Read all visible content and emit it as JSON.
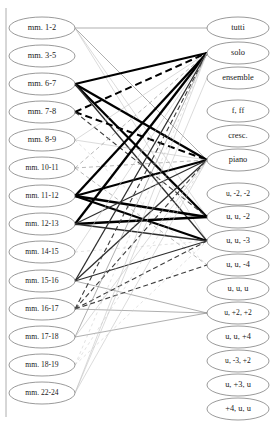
{
  "figure": {
    "type": "bipartite-graph",
    "title": "",
    "width": 274,
    "height": 425,
    "background": "#ffffff",
    "border_color": "#9a9a9a"
  },
  "left_nodes": [
    {
      "id": "L0",
      "label": "mm. 1-2",
      "x": 42,
      "y": 28,
      "rx": 33,
      "ry": 11
    },
    {
      "id": "L1",
      "label": "mm. 3-5",
      "x": 42,
      "y": 56,
      "rx": 33,
      "ry": 11
    },
    {
      "id": "L2",
      "label": "mm. 6-7",
      "x": 42,
      "y": 84,
      "rx": 33,
      "ry": 11
    },
    {
      "id": "L3",
      "label": "mm. 7-8",
      "x": 42,
      "y": 112,
      "rx": 33,
      "ry": 11
    },
    {
      "id": "L4",
      "label": "mm. 8-9",
      "x": 42,
      "y": 140,
      "rx": 33,
      "ry": 11
    },
    {
      "id": "L5",
      "label": "mm. 10-11",
      "x": 42,
      "y": 168,
      "rx": 33,
      "ry": 11
    },
    {
      "id": "L6",
      "label": "mm. 11-12",
      "x": 42,
      "y": 196,
      "rx": 33,
      "ry": 11
    },
    {
      "id": "L7",
      "label": "mm. 12-13",
      "x": 42,
      "y": 224,
      "rx": 33,
      "ry": 11
    },
    {
      "id": "L8",
      "label": "mm. 14-15",
      "x": 42,
      "y": 252,
      "rx": 33,
      "ry": 11
    },
    {
      "id": "L9",
      "label": "mm. 15-16",
      "x": 42,
      "y": 281,
      "rx": 33,
      "ry": 11
    },
    {
      "id": "L10",
      "label": "mm. 16-17",
      "x": 42,
      "y": 309,
      "rx": 33,
      "ry": 11
    },
    {
      "id": "L11",
      "label": "mm. 17-18",
      "x": 42,
      "y": 337,
      "rx": 33,
      "ry": 11
    },
    {
      "id": "L12",
      "label": "mm. 18-19",
      "x": 42,
      "y": 365,
      "rx": 33,
      "ry": 11
    },
    {
      "id": "L13",
      "label": "mm. 22-24",
      "x": 42,
      "y": 393,
      "rx": 33,
      "ry": 11
    }
  ],
  "right_nodes": [
    {
      "id": "R0",
      "label": "tutti",
      "x": 238,
      "y": 28,
      "rx": 31,
      "ry": 11
    },
    {
      "id": "R1",
      "label": "solo",
      "x": 238,
      "y": 53,
      "rx": 31,
      "ry": 11
    },
    {
      "id": "R2",
      "label": "ensemble",
      "x": 238,
      "y": 78,
      "rx": 31,
      "ry": 11
    },
    {
      "id": "R3",
      "label": "f, ff",
      "x": 238,
      "y": 111,
      "rx": 31,
      "ry": 11
    },
    {
      "id": "R4",
      "label": "cresc.",
      "x": 238,
      "y": 136,
      "rx": 31,
      "ry": 11
    },
    {
      "id": "R5",
      "label": "piano",
      "x": 238,
      "y": 160,
      "rx": 31,
      "ry": 11
    },
    {
      "id": "R6",
      "label": "u, -2, -2",
      "x": 238,
      "y": 194,
      "rx": 31,
      "ry": 11
    },
    {
      "id": "R7",
      "label": "u, u, -2",
      "x": 238,
      "y": 217,
      "rx": 31,
      "ry": 11
    },
    {
      "id": "R8",
      "label": "u, u, -3",
      "x": 238,
      "y": 241,
      "rx": 31,
      "ry": 11
    },
    {
      "id": "R9",
      "label": "u, u, -4",
      "x": 238,
      "y": 265,
      "rx": 31,
      "ry": 11
    },
    {
      "id": "R10",
      "label": "u, u, u",
      "x": 238,
      "y": 289,
      "rx": 31,
      "ry": 11
    },
    {
      "id": "R11",
      "label": "u, +2, +2",
      "x": 238,
      "y": 313,
      "rx": 31,
      "ry": 11
    },
    {
      "id": "R12",
      "label": "u, u, +4",
      "x": 238,
      "y": 337,
      "rx": 31,
      "ry": 11
    },
    {
      "id": "R13",
      "label": "u, -3, +2",
      "x": 238,
      "y": 361,
      "rx": 31,
      "ry": 11
    },
    {
      "id": "R14",
      "label": "u, +3, u",
      "x": 238,
      "y": 385,
      "rx": 31,
      "ry": 11
    },
    {
      "id": "R15",
      "label": "+4, u, u",
      "x": 238,
      "y": 409,
      "rx": 31,
      "ry": 11
    }
  ],
  "edge_styles": {
    "thick_solid": {
      "color": "#000000",
      "width": 2.3,
      "dash": "none"
    },
    "thick_dashed": {
      "color": "#000000",
      "width": 2.0,
      "dash": "7,4"
    },
    "medium_solid": {
      "color": "#2e2e2e",
      "width": 1.3,
      "dash": "none"
    },
    "medium_dashed": {
      "color": "#3d3d3d",
      "width": 1.1,
      "dash": "5,3"
    },
    "thin_solid": {
      "color": "#8c8c8c",
      "width": 0.7,
      "dash": "none"
    },
    "thin_dashed": {
      "color": "#9a9a9a",
      "width": 0.7,
      "dash": "4,3"
    },
    "faint_solid": {
      "color": "#c2c2c2",
      "width": 0.6,
      "dash": "none"
    },
    "faint_dashed": {
      "color": "#cfcfcf",
      "width": 0.6,
      "dash": "3,3"
    }
  },
  "edges": [
    {
      "from": "L0",
      "to": "R0",
      "style": "thin_solid"
    },
    {
      "from": "L0",
      "to": "R5",
      "style": "thin_solid"
    },
    {
      "from": "L0",
      "to": "R7",
      "style": "faint_solid"
    },
    {
      "from": "L0",
      "to": "R8",
      "style": "faint_solid"
    },
    {
      "from": "L2",
      "to": "R1",
      "style": "thick_solid"
    },
    {
      "from": "L2",
      "to": "R5",
      "style": "thick_solid"
    },
    {
      "from": "L2",
      "to": "R7",
      "style": "thick_solid"
    },
    {
      "from": "L2",
      "to": "R8",
      "style": "medium_solid"
    },
    {
      "from": "L3",
      "to": "R1",
      "style": "thick_dashed"
    },
    {
      "from": "L3",
      "to": "R5",
      "style": "thick_dashed"
    },
    {
      "from": "L3",
      "to": "R7",
      "style": "medium_dashed"
    },
    {
      "from": "L4",
      "to": "R1",
      "style": "faint_solid"
    },
    {
      "from": "L4",
      "to": "R5",
      "style": "faint_solid"
    },
    {
      "from": "L4",
      "to": "R9",
      "style": "faint_dashed"
    },
    {
      "from": "L5",
      "to": "R1",
      "style": "thin_dashed"
    },
    {
      "from": "L5",
      "to": "R5",
      "style": "thin_dashed"
    },
    {
      "from": "L5",
      "to": "R9",
      "style": "thin_dashed"
    },
    {
      "from": "L6",
      "to": "R1",
      "style": "thick_solid"
    },
    {
      "from": "L6",
      "to": "R5",
      "style": "thick_solid"
    },
    {
      "from": "L6",
      "to": "R7",
      "style": "thick_solid"
    },
    {
      "from": "L6",
      "to": "R8",
      "style": "thick_solid"
    },
    {
      "from": "L7",
      "to": "R1",
      "style": "thick_solid"
    },
    {
      "from": "L7",
      "to": "R7",
      "style": "thick_solid"
    },
    {
      "from": "L7",
      "to": "R8",
      "style": "medium_solid"
    },
    {
      "from": "L7",
      "to": "R5",
      "style": "medium_solid"
    },
    {
      "from": "L8",
      "to": "R1",
      "style": "faint_solid"
    },
    {
      "from": "L8",
      "to": "R8",
      "style": "faint_dashed"
    },
    {
      "from": "L9",
      "to": "R1",
      "style": "medium_solid"
    },
    {
      "from": "L9",
      "to": "R5",
      "style": "medium_solid"
    },
    {
      "from": "L9",
      "to": "R8",
      "style": "medium_solid"
    },
    {
      "from": "L9",
      "to": "R11",
      "style": "thin_solid"
    },
    {
      "from": "L10",
      "to": "R1",
      "style": "medium_dashed"
    },
    {
      "from": "L10",
      "to": "R5",
      "style": "medium_dashed"
    },
    {
      "from": "L10",
      "to": "R8",
      "style": "medium_dashed"
    },
    {
      "from": "L10",
      "to": "R9",
      "style": "medium_dashed"
    },
    {
      "from": "L10",
      "to": "R11",
      "style": "thin_solid"
    },
    {
      "from": "L11",
      "to": "R1",
      "style": "thin_solid"
    },
    {
      "from": "L11",
      "to": "R5",
      "style": "faint_solid"
    },
    {
      "from": "L11",
      "to": "R11",
      "style": "thin_solid"
    },
    {
      "from": "L12",
      "to": "R1",
      "style": "faint_dashed"
    },
    {
      "from": "L12",
      "to": "R5",
      "style": "faint_dashed"
    },
    {
      "from": "L12",
      "to": "R8",
      "style": "faint_dashed"
    },
    {
      "from": "L13",
      "to": "R1",
      "style": "faint_solid"
    },
    {
      "from": "L13",
      "to": "R5",
      "style": "faint_solid"
    },
    {
      "from": "L13",
      "to": "R2",
      "style": "faint_solid"
    }
  ]
}
